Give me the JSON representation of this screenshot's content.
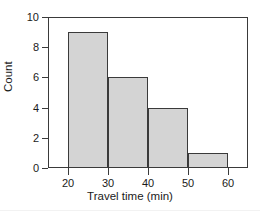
{
  "chart_data": {
    "type": "bar",
    "subtype": "histogram",
    "title": "",
    "xlabel": "Travel time (min)",
    "ylabel": "Count",
    "bin_edges": [
      20,
      30,
      40,
      50,
      60
    ],
    "categories": [
      "20-30",
      "30-40",
      "40-50",
      "50-60"
    ],
    "values": [
      9,
      6,
      4,
      1
    ],
    "bins": [
      {
        "label": "20-30",
        "start": 20,
        "end": 30,
        "count": 9
      },
      {
        "label": "30-40",
        "start": 30,
        "end": 40,
        "count": 6
      },
      {
        "label": "40-50",
        "start": 40,
        "end": 50,
        "count": 4
      },
      {
        "label": "50-60",
        "start": 50,
        "end": 60,
        "count": 1
      }
    ],
    "xlim": [
      15,
      65
    ],
    "ylim": [
      0,
      10
    ],
    "xticks": [
      20,
      30,
      40,
      50,
      60
    ],
    "xtick_labels": [
      "20",
      "30",
      "40",
      "50",
      "60"
    ],
    "yticks": [
      0,
      2,
      4,
      6,
      8,
      10
    ],
    "ytick_labels": [
      "0",
      "2",
      "4",
      "6",
      "8",
      "10"
    ],
    "grid": false,
    "legend": false,
    "legend_position": "none",
    "bar_fill_color": "#d4d4d4",
    "bar_edge_color": "#3a3a3a",
    "axis_color": "#3a3a3a",
    "background_color": "#ffffff",
    "text_color": "#1a1a1a"
  }
}
